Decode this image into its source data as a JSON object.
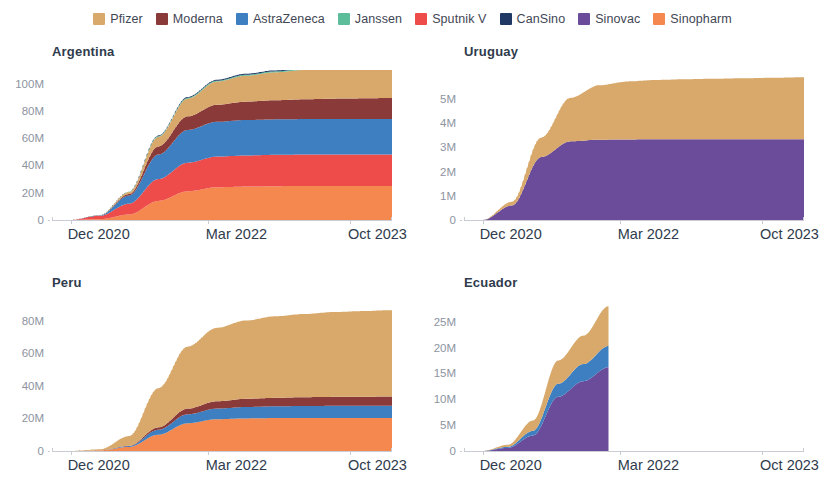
{
  "legend": {
    "position": "top-center",
    "items": [
      {
        "label": "Pfizer",
        "color": "#d8a96b",
        "key": "pfizer"
      },
      {
        "label": "Moderna",
        "color": "#8b3a3a",
        "key": "moderna"
      },
      {
        "label": "AstraZeneca",
        "color": "#3d7fc1",
        "key": "astrazeneca"
      },
      {
        "label": "Janssen",
        "color": "#5bbd9a",
        "key": "janssen"
      },
      {
        "label": "Sputnik V",
        "color": "#ee4b4b",
        "key": "sputnik_v"
      },
      {
        "label": "CanSino",
        "color": "#1f3864",
        "key": "cansino"
      },
      {
        "label": "Sinovac",
        "color": "#6b4c9a",
        "key": "sinovac"
      },
      {
        "label": "Sinopharm",
        "color": "#f4884f",
        "key": "sinopharm"
      }
    ]
  },
  "x_axis": {
    "ticks": [
      "Dec 2020",
      "Mar 2022",
      "Oct 2023"
    ],
    "tick_fractions": [
      0.055,
      0.46,
      0.875
    ],
    "range_start": "Dec 2020",
    "range_end": "Oct 2023"
  },
  "chart_data": [
    {
      "type": "area",
      "stacked": true,
      "title": "Argentina",
      "xlabel": "",
      "ylabel": "",
      "grid": false,
      "x": [
        "Dec 2020",
        "Mar 2021",
        "Jun 2021",
        "Sep 2021",
        "Dec 2021",
        "Mar 2022",
        "Jun 2022",
        "Sep 2022",
        "Dec 2022",
        "Mar 2023",
        "Jun 2023",
        "Oct 2023"
      ],
      "ylim": [
        0,
        110000000
      ],
      "yticks": [
        0,
        20000000,
        40000000,
        60000000,
        80000000,
        100000000
      ],
      "ytick_labels": [
        "0",
        "20M",
        "40M",
        "60M",
        "80M",
        "100M"
      ],
      "series": [
        {
          "name": "Sinopharm",
          "color": "#f4884f",
          "values": [
            0,
            600000,
            4000000,
            14000000,
            21000000,
            24000000,
            24500000,
            24800000,
            25000000,
            25000000,
            25000000,
            25000000
          ]
        },
        {
          "name": "Sputnik V",
          "color": "#ee4b4b",
          "values": [
            0,
            2500000,
            8000000,
            16000000,
            21000000,
            22500000,
            22800000,
            23000000,
            23000000,
            23000000,
            23000000,
            23000000
          ]
        },
        {
          "name": "AstraZeneca",
          "color": "#3d7fc1",
          "values": [
            0,
            300000,
            6000000,
            18000000,
            24000000,
            25500000,
            26000000,
            26000000,
            26000000,
            26000000,
            26000000,
            26000000
          ]
        },
        {
          "name": "Moderna",
          "color": "#8b3a3a",
          "values": [
            0,
            0,
            1000000,
            6000000,
            10000000,
            12500000,
            13500000,
            14000000,
            14500000,
            15000000,
            15200000,
            15500000
          ]
        },
        {
          "name": "Pfizer",
          "color": "#d8a96b",
          "values": [
            0,
            100000,
            1500000,
            7000000,
            13000000,
            17000000,
            19000000,
            20500000,
            21500000,
            22500000,
            23500000,
            24500000
          ]
        },
        {
          "name": "Janssen",
          "color": "#5bbd9a",
          "values": [
            0,
            0,
            200000,
            500000,
            600000,
            650000,
            700000,
            700000,
            700000,
            700000,
            700000,
            700000
          ]
        },
        {
          "name": "CanSino",
          "color": "#1f3864",
          "values": [
            0,
            0,
            100000,
            400000,
            600000,
            700000,
            700000,
            700000,
            700000,
            700000,
            700000,
            700000
          ]
        }
      ],
      "total_final": 115000000
    },
    {
      "type": "area",
      "stacked": true,
      "title": "Uruguay",
      "xlabel": "",
      "ylabel": "",
      "grid": false,
      "x": [
        "Dec 2020",
        "Mar 2021",
        "Jun 2021",
        "Sep 2021",
        "Dec 2021",
        "Mar 2022",
        "Jun 2022",
        "Sep 2022",
        "Dec 2022",
        "Mar 2023",
        "Jun 2023",
        "Oct 2023"
      ],
      "ylim": [
        0,
        6200000
      ],
      "yticks": [
        0,
        1000000,
        2000000,
        3000000,
        4000000,
        5000000
      ],
      "ytick_labels": [
        "0",
        "1M",
        "2M",
        "3M",
        "4M",
        "5M"
      ],
      "series": [
        {
          "name": "Sinovac",
          "color": "#6b4c9a",
          "values": [
            0,
            600000,
            2600000,
            3250000,
            3320000,
            3330000,
            3340000,
            3340000,
            3340000,
            3340000,
            3340000,
            3340000
          ]
        },
        {
          "name": "Pfizer",
          "color": "#d8a96b",
          "values": [
            0,
            150000,
            800000,
            1800000,
            2250000,
            2400000,
            2450000,
            2480000,
            2500000,
            2520000,
            2540000,
            2560000
          ]
        }
      ],
      "total_final": 5900000
    },
    {
      "type": "area",
      "stacked": true,
      "title": "Peru",
      "xlabel": "",
      "ylabel": "",
      "grid": false,
      "x": [
        "Dec 2020",
        "Mar 2021",
        "Jun 2021",
        "Sep 2021",
        "Dec 2021",
        "Mar 2022",
        "Jun 2022",
        "Sep 2022",
        "Dec 2022",
        "Mar 2023",
        "Jun 2023",
        "Oct 2023"
      ],
      "ylim": [
        0,
        92000000
      ],
      "yticks": [
        0,
        20000000,
        40000000,
        60000000,
        80000000
      ],
      "ytick_labels": [
        "0",
        "20M",
        "40M",
        "60M",
        "80M"
      ],
      "series": [
        {
          "name": "Sinopharm",
          "color": "#f4884f",
          "values": [
            0,
            400000,
            2500000,
            10000000,
            17000000,
            19500000,
            20000000,
            20200000,
            20300000,
            20300000,
            20300000,
            20300000
          ]
        },
        {
          "name": "AstraZeneca",
          "color": "#3d7fc1",
          "values": [
            0,
            0,
            500000,
            3000000,
            5500000,
            6500000,
            7000000,
            7200000,
            7300000,
            7400000,
            7400000,
            7400000
          ]
        },
        {
          "name": "Moderna",
          "color": "#8b3a3a",
          "values": [
            0,
            0,
            200000,
            1500000,
            3500000,
            4500000,
            5000000,
            5200000,
            5400000,
            5500000,
            5600000,
            5700000
          ]
        },
        {
          "name": "Pfizer",
          "color": "#d8a96b",
          "values": [
            0,
            600000,
            6000000,
            24000000,
            38000000,
            45000000,
            48000000,
            50000000,
            51000000,
            52000000,
            52500000,
            53000000
          ]
        }
      ],
      "total_final": 86000000
    },
    {
      "type": "area",
      "stacked": true,
      "title": "Ecuador",
      "xlabel": "",
      "ylabel": "",
      "grid": false,
      "note": "series ends Jan 2022",
      "x": [
        "Dec 2020",
        "Mar 2021",
        "Jun 2021",
        "Sep 2021",
        "Nov 2021",
        "Jan 2022"
      ],
      "ylim": [
        0,
        29000000
      ],
      "yticks": [
        0,
        5000000,
        10000000,
        15000000,
        20000000,
        25000000
      ],
      "ytick_labels": [
        "0",
        "5M",
        "10M",
        "15M",
        "20M",
        "25M"
      ],
      "series": [
        {
          "name": "Sinovac",
          "color": "#6b4c9a",
          "values": [
            0,
            600000,
            3000000,
            10500000,
            13500000,
            16200000
          ]
        },
        {
          "name": "AstraZeneca",
          "color": "#3d7fc1",
          "values": [
            0,
            200000,
            900000,
            2500000,
            3300000,
            4100000
          ]
        },
        {
          "name": "Pfizer",
          "color": "#d8a96b",
          "values": [
            0,
            400000,
            2000000,
            4500000,
            5500000,
            7700000
          ]
        }
      ],
      "total_final": 28000000
    }
  ]
}
